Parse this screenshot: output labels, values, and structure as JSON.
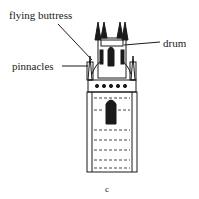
{
  "diagram": {
    "labels": {
      "flying_buttress": "flying buttress",
      "drum": "drum",
      "pinnacles": "pinnacles"
    },
    "caption": "c"
  }
}
